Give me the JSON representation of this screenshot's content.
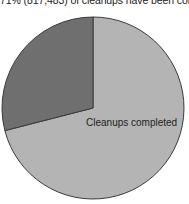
{
  "chart_data": {
    "type": "pie",
    "title": "71% (817,483) of cleanups have been completed",
    "slices": [
      {
        "label": "Cleanups completed",
        "value": 71,
        "color": "#b4b4b4",
        "labeled": true
      },
      {
        "label": "Cleanups remaining",
        "value": 29,
        "color": "#6f6f6f",
        "labeled": false
      }
    ],
    "start_angle": "12 o'clock",
    "direction": "clockwise for completed slice",
    "legend": "none",
    "outline_color": "#3a3a3a"
  },
  "labels": {
    "title": "71% (817,483) of cleanups have been completed",
    "completed_slice": "Cleanups completed"
  }
}
